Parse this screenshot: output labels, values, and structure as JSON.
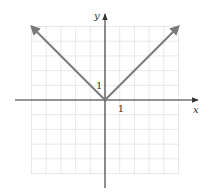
{
  "chart_data": {
    "type": "line",
    "title": "",
    "xlabel": "x",
    "ylabel": "y",
    "xlim": [
      -5,
      5
    ],
    "ylim": [
      -5,
      5
    ],
    "grid": true,
    "tick_labels": {
      "x": "1",
      "y": "1"
    },
    "series": [
      {
        "name": "y = |x| left branch",
        "points": [
          [
            0,
            0
          ],
          [
            -5,
            5
          ]
        ],
        "arrow_end": true
      },
      {
        "name": "y = |x| right branch",
        "points": [
          [
            0,
            0
          ],
          [
            5,
            5
          ]
        ],
        "arrow_end": true
      }
    ],
    "colors": {
      "curve": "#7a7a7a",
      "axis": "#333333",
      "grid": "#c8c8c8"
    }
  }
}
